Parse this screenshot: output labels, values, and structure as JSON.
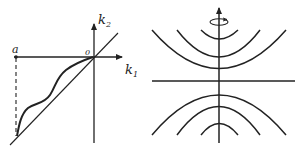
{
  "left_panel": {
    "axis_labels": {
      "x_main": "k",
      "x_sub": "1",
      "y_main": "k",
      "y_sub": "2"
    },
    "origin_label": "0",
    "point_label": "a"
  },
  "right_panel": {
    "description": "two families of nested arcs around a vertical rotation axis",
    "icon": "rotation-arrow-icon"
  },
  "colors": {
    "ink": "#222222",
    "background": "#ffffff"
  }
}
